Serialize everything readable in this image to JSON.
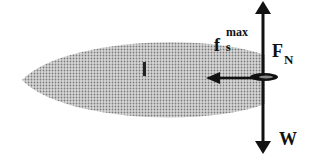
{
  "diagram": {
    "title": "",
    "labels": {
      "friction_main": "f",
      "friction_sub": "s",
      "friction_sup": "max",
      "normal_main": "F",
      "normal_sub": "N",
      "weight": "W",
      "length": "l"
    },
    "colors": {
      "body_fill": "#a8a8a8",
      "arrow": "#111111",
      "background": "#ffffff"
    }
  }
}
